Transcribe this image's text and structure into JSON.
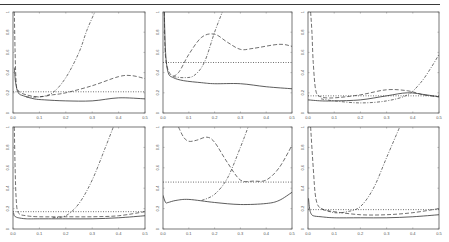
{
  "caption": {
    "text": "Figure ... (caption cut off at top of image)"
  },
  "layout": {
    "panels": [
      {
        "id": "p1",
        "x0": 13,
        "x1": 145,
        "y0": 12,
        "y1": 113
      },
      {
        "id": "p2",
        "x0": 163,
        "x1": 292,
        "y0": 12,
        "y1": 113
      },
      {
        "id": "p3",
        "x0": 308,
        "x1": 439,
        "y0": 12,
        "y1": 113
      },
      {
        "id": "p4",
        "x0": 13,
        "x1": 145,
        "y0": 127,
        "y1": 229
      },
      {
        "id": "p5",
        "x0": 163,
        "x1": 292,
        "y0": 127,
        "y1": 229
      },
      {
        "id": "p6",
        "x0": 308,
        "x1": 439,
        "y0": 127,
        "y1": 229
      }
    ]
  },
  "chart_data": [
    {
      "type": "line",
      "panel": "top-left",
      "title": "",
      "xlabel": "",
      "ylabel": "",
      "xlim": [
        0,
        0.5
      ],
      "ylim": [
        0,
        1
      ],
      "xticks": [
        "0.0",
        "0.1",
        "0.2",
        "0.3",
        "0.4",
        "0.5"
      ],
      "yticks": [
        "0",
        "0.2",
        "0.4",
        "0.6",
        "0.8",
        "1"
      ],
      "grid": false,
      "series": [
        {
          "name": "solid",
          "style": "solid",
          "x": [
            0.005,
            0.01,
            0.02,
            0.04,
            0.08,
            0.12,
            0.2,
            0.3,
            0.4,
            0.5
          ],
          "y": [
            0.45,
            0.3,
            0.2,
            0.17,
            0.14,
            0.13,
            0.12,
            0.12,
            0.15,
            0.14
          ]
        },
        {
          "name": "dashed",
          "style": "dashed",
          "x": [
            0.005,
            0.008,
            0.012,
            0.02,
            0.05,
            0.1,
            0.15,
            0.2,
            0.3,
            0.4,
            0.45,
            0.5
          ],
          "y": [
            1.0,
            0.6,
            0.3,
            0.22,
            0.18,
            0.16,
            0.18,
            0.2,
            0.27,
            0.36,
            0.37,
            0.34
          ]
        },
        {
          "name": "dotted",
          "style": "dotted",
          "x": [
            0,
            0.5
          ],
          "y": [
            0.21,
            0.21
          ]
        },
        {
          "name": "dashdot",
          "style": "dashdot",
          "x": [
            0.05,
            0.1,
            0.15,
            0.2,
            0.25,
            0.28,
            0.31
          ],
          "y": [
            0.16,
            0.16,
            0.2,
            0.35,
            0.6,
            0.82,
            1.0
          ]
        }
      ]
    },
    {
      "type": "line",
      "panel": "top-middle",
      "title": "",
      "xlim": [
        0,
        0.5
      ],
      "ylim": [
        0,
        1
      ],
      "xticks": [
        "0.0",
        "0.1",
        "0.2",
        "0.3",
        "0.4",
        "0.5"
      ],
      "yticks": [
        "0",
        "0.2",
        "0.4",
        "0.6",
        "0.8",
        "1"
      ],
      "grid": false,
      "series": [
        {
          "name": "solid",
          "style": "solid",
          "x": [
            0.005,
            0.01,
            0.02,
            0.04,
            0.08,
            0.15,
            0.2,
            0.3,
            0.4,
            0.5
          ],
          "y": [
            1.0,
            0.6,
            0.4,
            0.35,
            0.32,
            0.3,
            0.29,
            0.29,
            0.26,
            0.24
          ]
        },
        {
          "name": "dashed",
          "style": "dashed",
          "x": [
            0.005,
            0.01,
            0.03,
            0.06,
            0.1,
            0.15,
            0.2,
            0.25,
            0.3,
            0.35,
            0.45,
            0.5
          ],
          "y": [
            1.0,
            0.55,
            0.38,
            0.4,
            0.58,
            0.75,
            0.78,
            0.7,
            0.63,
            0.64,
            0.68,
            0.66
          ]
        },
        {
          "name": "dotted",
          "style": "dotted",
          "x": [
            0,
            0.5
          ],
          "y": [
            0.5,
            0.5
          ]
        },
        {
          "name": "dashdot",
          "style": "dashdot",
          "x": [
            0.04,
            0.08,
            0.12,
            0.16,
            0.2,
            0.23
          ],
          "y": [
            0.36,
            0.35,
            0.37,
            0.5,
            0.8,
            1.0
          ]
        }
      ]
    },
    {
      "type": "line",
      "panel": "top-right",
      "title": "",
      "xlim": [
        0,
        0.5
      ],
      "ylim": [
        0,
        1
      ],
      "xticks": [
        "0.0",
        "0.1",
        "0.2",
        "0.3",
        "0.4",
        "0.5"
      ],
      "yticks": [
        "0",
        "0.2",
        "0.4",
        "0.6",
        "0.8",
        "1"
      ],
      "grid": false,
      "series": [
        {
          "name": "solid",
          "style": "solid",
          "x": [
            0,
            0.05,
            0.1,
            0.2,
            0.3,
            0.38,
            0.45,
            0.5
          ],
          "y": [
            0.13,
            0.12,
            0.12,
            0.13,
            0.17,
            0.2,
            0.18,
            0.16
          ]
        },
        {
          "name": "dashed",
          "style": "dashed",
          "x": [
            0.01,
            0.015,
            0.02,
            0.03,
            0.05,
            0.1,
            0.2,
            0.3,
            0.38,
            0.44,
            0.5
          ],
          "y": [
            1.0,
            0.8,
            0.5,
            0.22,
            0.16,
            0.15,
            0.18,
            0.23,
            0.22,
            0.18,
            0.16
          ]
        },
        {
          "name": "dotted",
          "style": "dotted",
          "x": [
            0,
            0.5
          ],
          "y": [
            0.17,
            0.17
          ]
        },
        {
          "name": "dashdot",
          "style": "dashdot",
          "x": [
            0.05,
            0.1,
            0.2,
            0.3,
            0.38,
            0.43,
            0.47,
            0.5
          ],
          "y": [
            0.14,
            0.12,
            0.1,
            0.12,
            0.18,
            0.3,
            0.45,
            0.58
          ]
        }
      ]
    },
    {
      "type": "line",
      "panel": "bottom-left",
      "title": "",
      "xlim": [
        0,
        0.5
      ],
      "ylim": [
        0,
        1
      ],
      "xticks": [
        "0.0",
        "0.1",
        "0.2",
        "0.3",
        "0.4",
        "0.5"
      ],
      "yticks": [
        "0",
        "0.2",
        "0.4",
        "0.6",
        "0.8",
        "1"
      ],
      "grid": false,
      "series": [
        {
          "name": "solid",
          "style": "solid",
          "x": [
            0.002,
            0.005,
            0.01,
            0.02,
            0.05,
            0.1,
            0.2,
            0.3,
            0.4,
            0.5
          ],
          "y": [
            0.16,
            0.13,
            0.12,
            0.11,
            0.1,
            0.1,
            0.1,
            0.1,
            0.11,
            0.13
          ]
        },
        {
          "name": "dashed",
          "style": "dashed",
          "x": [
            0.005,
            0.008,
            0.012,
            0.02,
            0.05,
            0.1,
            0.2,
            0.3,
            0.4,
            0.5
          ],
          "y": [
            1.0,
            0.6,
            0.3,
            0.16,
            0.13,
            0.12,
            0.12,
            0.12,
            0.13,
            0.17
          ]
        },
        {
          "name": "dotted",
          "style": "dotted",
          "x": [
            0,
            0.5
          ],
          "y": [
            0.17,
            0.17
          ]
        },
        {
          "name": "dashdot",
          "style": "dashdot",
          "x": [
            0.15,
            0.2,
            0.25,
            0.3,
            0.35,
            0.38
          ],
          "y": [
            0.11,
            0.13,
            0.25,
            0.48,
            0.8,
            1.0
          ]
        }
      ]
    },
    {
      "type": "line",
      "panel": "bottom-middle",
      "title": "",
      "xlim": [
        0,
        0.5
      ],
      "ylim": [
        0,
        1
      ],
      "xticks": [
        "0.0",
        "0.1",
        "0.2",
        "0.3",
        "0.4",
        "0.5"
      ],
      "yticks": [
        "0",
        "0.2",
        "0.4",
        "0.6",
        "0.8",
        "1"
      ],
      "grid": false,
      "series": [
        {
          "name": "solid",
          "style": "solid",
          "x": [
            0,
            0.01,
            0.02,
            0.05,
            0.1,
            0.2,
            0.3,
            0.4,
            0.45,
            0.5
          ],
          "y": [
            0.33,
            0.26,
            0.26,
            0.28,
            0.29,
            0.26,
            0.24,
            0.25,
            0.28,
            0.36
          ]
        },
        {
          "name": "dashed",
          "style": "dashed",
          "x": [
            0.06,
            0.08,
            0.1,
            0.13,
            0.17,
            0.2,
            0.25,
            0.3,
            0.35,
            0.4,
            0.45,
            0.5
          ],
          "y": [
            1.0,
            0.9,
            0.86,
            0.87,
            0.9,
            0.85,
            0.65,
            0.48,
            0.47,
            0.48,
            0.6,
            0.82
          ]
        },
        {
          "name": "dotted",
          "style": "dotted",
          "x": [
            0,
            0.5
          ],
          "y": [
            0.46,
            0.46
          ]
        },
        {
          "name": "dashdot",
          "style": "dashdot",
          "x": [
            0.15,
            0.2,
            0.25,
            0.3,
            0.33
          ],
          "y": [
            0.28,
            0.34,
            0.5,
            0.8,
            1.0
          ]
        }
      ]
    },
    {
      "type": "line",
      "panel": "bottom-right",
      "title": "",
      "xlim": [
        0,
        0.5
      ],
      "ylim": [
        0,
        1
      ],
      "xticks": [
        "0.0",
        "0.1",
        "0.2",
        "0.3",
        "0.4",
        "0.5"
      ],
      "yticks": [
        "0",
        "0.2",
        "0.4",
        "0.6",
        "0.8",
        "1"
      ],
      "grid": false,
      "series": [
        {
          "name": "solid",
          "style": "solid",
          "x": [
            0.002,
            0.005,
            0.01,
            0.02,
            0.05,
            0.1,
            0.2,
            0.3,
            0.4,
            0.5
          ],
          "y": [
            0.3,
            0.22,
            0.16,
            0.13,
            0.12,
            0.11,
            0.11,
            0.11,
            0.12,
            0.14
          ]
        },
        {
          "name": "dashed",
          "style": "dashed",
          "x": [
            0.01,
            0.02,
            0.03,
            0.05,
            0.1,
            0.2,
            0.3,
            0.4,
            0.5
          ],
          "y": [
            1.0,
            0.6,
            0.3,
            0.2,
            0.17,
            0.14,
            0.14,
            0.16,
            0.2
          ]
        },
        {
          "name": "dotted",
          "style": "dotted",
          "x": [
            0,
            0.5
          ],
          "y": [
            0.19,
            0.19
          ]
        },
        {
          "name": "dashdot",
          "style": "dashdot",
          "x": [
            0.05,
            0.1,
            0.15,
            0.2,
            0.25,
            0.3,
            0.35
          ],
          "y": [
            0.2,
            0.16,
            0.17,
            0.22,
            0.4,
            0.7,
            1.0
          ]
        }
      ]
    }
  ]
}
